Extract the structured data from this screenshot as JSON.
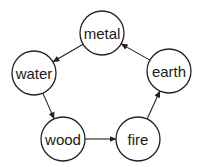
{
  "diagram": {
    "type": "cycle",
    "nodes": [
      {
        "id": "metal",
        "label": "metal",
        "cx": 102,
        "cy": 33,
        "r": 22
      },
      {
        "id": "earth",
        "label": "earth",
        "cx": 169,
        "cy": 71,
        "r": 22
      },
      {
        "id": "fire",
        "label": "fire",
        "cx": 138,
        "cy": 139,
        "r": 22
      },
      {
        "id": "wood",
        "label": "wood",
        "cx": 63,
        "cy": 139,
        "r": 22
      },
      {
        "id": "water",
        "label": "water",
        "cx": 34,
        "cy": 73,
        "r": 22
      }
    ],
    "edges": [
      {
        "from": "metal",
        "to": "water"
      },
      {
        "from": "water",
        "to": "wood"
      },
      {
        "from": "wood",
        "to": "fire"
      },
      {
        "from": "fire",
        "to": "earth"
      },
      {
        "from": "earth",
        "to": "metal"
      }
    ],
    "colors": {
      "stroke": "#222222",
      "fill": "#ffffff",
      "text": "#1a1a1a"
    }
  }
}
